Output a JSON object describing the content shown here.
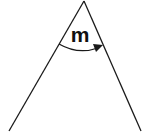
{
  "diagram": {
    "type": "angle",
    "angle_label": "m",
    "stroke_color": "#1a1a1a",
    "background": "#ffffff",
    "vertex": [
      84,
      1
    ],
    "ray_left_end": [
      9,
      131
    ],
    "ray_right_end": [
      141,
      131
    ],
    "arc": {
      "direction": "clockwise",
      "has_arrowhead": true
    }
  }
}
